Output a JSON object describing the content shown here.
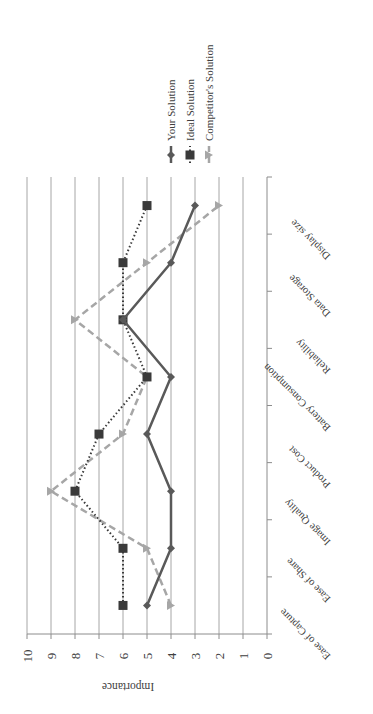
{
  "chart_data": {
    "type": "line",
    "orientation": "rotated-90 (value axis horizontal along bottom, categories along right edge)",
    "title": "",
    "xlabel": "",
    "ylabel": "Importance",
    "ylim": [
      0,
      10
    ],
    "yticks": [
      "0",
      "1",
      "2",
      "3",
      "4",
      "5",
      "6",
      "7",
      "8",
      "9",
      "10"
    ],
    "grid": true,
    "legend_position": "top-left (rotated)",
    "categories": [
      "Ease of Capture",
      "Ease of Share",
      "Image Quality",
      "Product Cost",
      "Battery Consumption",
      "Reliability",
      "Data Storage",
      "Display size"
    ],
    "series": [
      {
        "name": "Your Solution",
        "style": "solid",
        "marker": "diamond",
        "color": "#595959",
        "values": [
          5,
          4,
          4,
          5,
          4,
          6,
          4,
          3
        ]
      },
      {
        "name": "Ideal Solution",
        "style": "dotted",
        "marker": "square",
        "color": "#3a3a3a",
        "values": [
          6,
          6,
          8,
          7,
          5,
          6,
          6,
          5
        ]
      },
      {
        "name": "Competitor's Solution",
        "style": "dashed",
        "marker": "triangle",
        "color": "#a6a6a6",
        "values": [
          4,
          5,
          9,
          6,
          5,
          8,
          5,
          2
        ]
      }
    ]
  },
  "colors": {
    "gridline": "#a6a6a6",
    "axis": "#8c8c8c",
    "text": "#404040"
  }
}
